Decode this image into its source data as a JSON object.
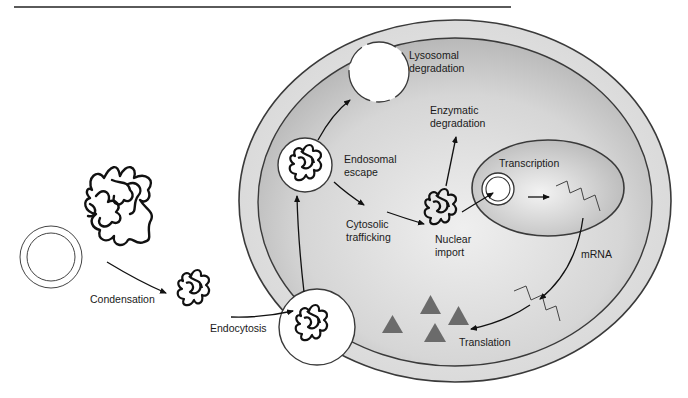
{
  "header": {
    "running_head_fragment": "",
    "rule": true
  },
  "diagram": {
    "labels": {
      "condensation": "Condensation",
      "endocytosis": "Endocytosis",
      "endosomal_escape_line1": "Endosomal",
      "endosomal_escape_line2": "escape",
      "lysosomal_line1": "Lysosomal",
      "lysosomal_line2": "degradation",
      "enzymatic_line1": "Enzymatic",
      "enzymatic_line2": "degradation",
      "cytosolic_line1": "Cytosolic",
      "cytosolic_line2": "trafficking",
      "nuclear_line1": "Nuclear",
      "nuclear_line2": "import",
      "transcription": "Transcription",
      "mrna": "mRNA",
      "translation": "Translation"
    },
    "elements": {
      "plasmid": "plasmid-dna",
      "free_dna": "free-dna-tangle",
      "polyplex": "condensed-complex",
      "endocytic_vesicle": "endocytic-vesicle",
      "endosome": "endosome",
      "lysosome": "lysosome",
      "cell": "cell",
      "cytoplasm": "cytoplasm",
      "nucleus": "nucleus",
      "nuclear_plasmid": "nuclear-plasmid",
      "mrna_nucleus": "mrna-strand",
      "mrna_cytoplasm": "mrna-strand",
      "proteins": "protein-triangles"
    },
    "colors": {
      "membrane_outer_fill": "#e4e4e4",
      "cytoplasm_fill": "#c9c9c9",
      "cytoplasm_center": "#ececec",
      "nucleus_fill": "#d6d6d6",
      "stroke": "#3a3a3a",
      "protein": "#6b6b6b",
      "ink": "#111111"
    }
  }
}
